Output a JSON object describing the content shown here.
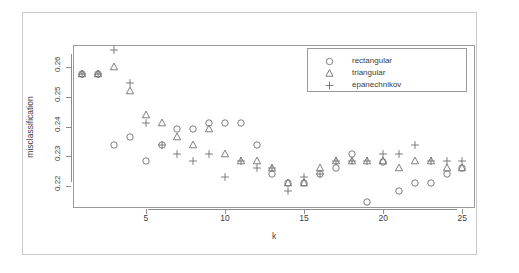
{
  "chart_data": {
    "type": "scatter",
    "title": "",
    "xlabel": "k",
    "ylabel": "misclassification",
    "xlim": [
      0.4,
      25.8
    ],
    "ylim": [
      0.2128,
      0.2672
    ],
    "grid": false,
    "legend_position": "top-right",
    "xticks": [
      5,
      10,
      15,
      20,
      25
    ],
    "xtick_labels": [
      "5",
      "10",
      "15",
      "20",
      "25"
    ],
    "yticks": [
      0.22,
      0.23,
      0.24,
      0.25,
      0.26
    ],
    "ytick_labels": [
      "0.22",
      "0.23",
      "0.24",
      "0.25",
      "0.26"
    ],
    "x": [
      1,
      2,
      3,
      4,
      5,
      6,
      7,
      8,
      9,
      10,
      11,
      12,
      13,
      14,
      15,
      16,
      17,
      18,
      19,
      20,
      21,
      22,
      23,
      24,
      25
    ],
    "series": [
      {
        "name": "rectangular",
        "marker": "circle",
        "color": "#6f6f6f",
        "values": [
          0.2575,
          0.2575,
          0.2337,
          0.2365,
          0.2285,
          0.2337,
          0.239,
          0.239,
          0.2412,
          0.2412,
          0.2412,
          0.2337,
          0.2243,
          0.221,
          0.221,
          0.2243,
          0.2262,
          0.2308,
          0.2148,
          0.2283,
          0.2185,
          0.221,
          0.221,
          0.2243,
          0.2262
        ]
      },
      {
        "name": "triangular",
        "marker": "triangle",
        "color": "#6f6f6f",
        "values": [
          0.2575,
          0.2575,
          0.26,
          0.252,
          0.244,
          0.2413,
          0.2365,
          0.2337,
          0.239,
          0.2308,
          0.2285,
          0.2285,
          0.2262,
          0.221,
          0.221,
          0.2262,
          0.2285,
          0.2285,
          0.2285,
          0.2285,
          0.2262,
          0.2285,
          0.2285,
          0.2262,
          0.2262
        ]
      },
      {
        "name": "epanechnikov",
        "marker": "plus",
        "color": "#6f6f6f",
        "values": [
          0.2575,
          0.2575,
          0.2655,
          0.2545,
          0.2413,
          0.2337,
          0.2308,
          0.2285,
          0.2308,
          0.2232,
          0.2285,
          0.2262,
          0.2262,
          0.2185,
          0.2232,
          0.2243,
          0.2285,
          0.2285,
          0.2285,
          0.2308,
          0.2308,
          0.2337,
          0.2285,
          0.2285,
          0.2285
        ]
      }
    ]
  },
  "legend": {
    "entries": [
      {
        "label": "rectangular",
        "marker": "circle"
      },
      {
        "label": "triangular",
        "marker": "triangle"
      },
      {
        "label": "epanechnikov",
        "marker": "plus"
      }
    ]
  },
  "axes": {
    "x_title": "k",
    "y_title": "misclassification"
  }
}
